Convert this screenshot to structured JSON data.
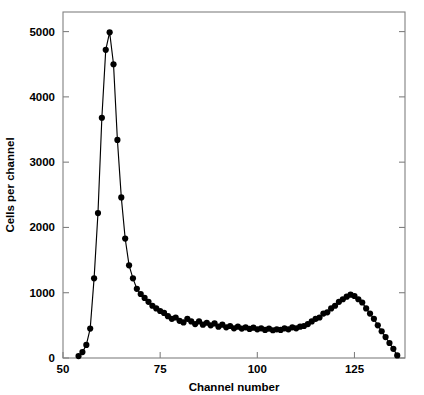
{
  "chart_data": {
    "type": "line",
    "title": "",
    "subtitle": "",
    "xlabel": "Channel number",
    "ylabel": "Cells per channel",
    "xlim": [
      50,
      138
    ],
    "ylim": [
      0,
      5300
    ],
    "xticks": [
      50,
      75,
      100,
      125
    ],
    "xtick_labels": [
      "50",
      "75",
      "100",
      "125"
    ],
    "yticks": [
      0,
      1000,
      2000,
      3000,
      4000,
      5000
    ],
    "ytick_labels": [
      "0",
      "1000",
      "2000",
      "3000",
      "4000",
      "5000"
    ],
    "grid": false,
    "legend": null,
    "marker": "filled-circle",
    "marker_size": 3.1,
    "line_color": "#000000",
    "marker_color": "#000000",
    "axis_color": "#808080",
    "background_color": "#ffffff",
    "frame": "full-box",
    "tick_direction": "in",
    "annotations": [],
    "series": [
      {
        "name": "DNA content histogram",
        "x": [
          54,
          55,
          56,
          57,
          58,
          59,
          60,
          61,
          62,
          63,
          64,
          65,
          66,
          67,
          68,
          69,
          70,
          71,
          72,
          73,
          74,
          75,
          76,
          77,
          78,
          79,
          80,
          81,
          82,
          83,
          84,
          85,
          86,
          87,
          88,
          89,
          90,
          91,
          92,
          93,
          94,
          95,
          96,
          97,
          98,
          99,
          100,
          101,
          102,
          103,
          104,
          105,
          106,
          107,
          108,
          109,
          110,
          111,
          112,
          113,
          114,
          115,
          116,
          117,
          118,
          119,
          120,
          121,
          122,
          123,
          124,
          125,
          126,
          127,
          128,
          129,
          130,
          131,
          132,
          133,
          134,
          135,
          136
        ],
        "y": [
          30,
          90,
          200,
          450,
          1220,
          2220,
          3680,
          4720,
          4990,
          4500,
          3340,
          2460,
          1830,
          1420,
          1220,
          1060,
          980,
          920,
          860,
          800,
          760,
          720,
          690,
          640,
          600,
          620,
          570,
          545,
          600,
          560,
          520,
          560,
          510,
          540,
          500,
          530,
          480,
          510,
          470,
          490,
          455,
          480,
          450,
          470,
          445,
          465,
          440,
          455,
          430,
          450,
          425,
          440,
          430,
          455,
          440,
          470,
          455,
          480,
          490,
          520,
          560,
          600,
          620,
          680,
          700,
          760,
          800,
          860,
          900,
          940,
          970,
          950,
          900,
          850,
          760,
          680,
          600,
          500,
          410,
          320,
          230,
          140,
          40
        ]
      }
    ]
  },
  "axes": {
    "xlabel": "Channel number",
    "ylabel": "Cells per channel"
  }
}
